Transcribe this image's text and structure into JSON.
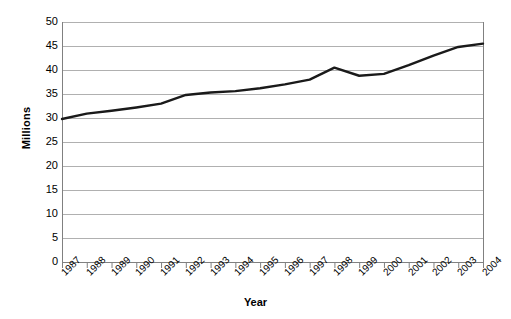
{
  "chart_data": {
    "type": "line",
    "title": "",
    "xlabel": "Year",
    "ylabel": "Millions",
    "categories": [
      "1987",
      "1988",
      "1989",
      "1990",
      "1991",
      "1992",
      "1993",
      "1994",
      "1995",
      "1996",
      "1997",
      "1998",
      "1999",
      "2000",
      "2001",
      "2002",
      "2003",
      "2004"
    ],
    "values": [
      29.8,
      30.9,
      31.5,
      32.2,
      33.0,
      34.8,
      35.3,
      35.6,
      36.2,
      37.0,
      38.0,
      40.5,
      38.8,
      39.2,
      41.0,
      43.0,
      44.8,
      45.5
    ],
    "series": [
      {
        "name": "Millions",
        "values": [
          29.8,
          30.9,
          31.5,
          32.2,
          33.0,
          34.8,
          35.3,
          35.6,
          36.2,
          37.0,
          38.0,
          40.5,
          38.8,
          39.2,
          41.0,
          43.0,
          44.8,
          45.5
        ]
      }
    ],
    "ylim": [
      0,
      50
    ],
    "yticks": [
      0,
      5,
      10,
      15,
      20,
      25,
      30,
      35,
      40,
      45,
      50
    ],
    "ytick_labels": [
      "0",
      "5",
      "10",
      "15",
      "20",
      "25",
      "30",
      "35",
      "40",
      "45",
      "50"
    ],
    "grid": "horizontal",
    "legend": "none",
    "line_color": "#1a1a1a",
    "grid_color": "#b0b0b0",
    "axis_color": "#808080",
    "background": "#ffffff"
  },
  "axes": {
    "y_title": "Millions",
    "x_title": "Year"
  }
}
